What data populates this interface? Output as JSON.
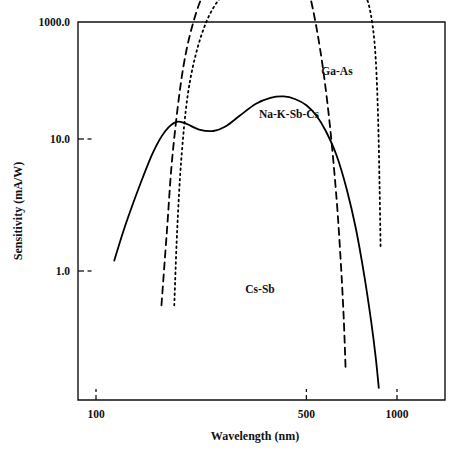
{
  "chart_data": {
    "type": "line",
    "title": "",
    "xlabel": "Wavelength (nm)",
    "ylabel": "Sensitivity (mA/W)",
    "xscale": "log",
    "yscale": "log",
    "xlim": [
      100,
      1300
    ],
    "ylim": [
      0.1,
      1000
    ],
    "xticks": [
      100,
      500,
      1000
    ],
    "xtick_labels": [
      "100",
      "500",
      "1000"
    ],
    "yticks": [
      1.0,
      10.0,
      1000.0
    ],
    "ytick_labels": [
      "1.0",
      "10.0",
      "1000.0"
    ],
    "grid": false,
    "legend": "inline-labels",
    "series": [
      {
        "name": "Cs-Sb",
        "style": "dashed",
        "label": "Cs-Sb",
        "label_x": 260,
        "label_y": 293,
        "x": [
          165,
          172,
          180,
          195,
          215,
          240,
          270,
          300,
          330,
          360,
          390,
          420,
          450,
          480,
          510,
          540,
          570,
          600,
          630,
          650,
          665,
          675
        ],
        "y": [
          0.55,
          2.0,
          8.0,
          35,
          90,
          160,
          230,
          290,
          330,
          350,
          345,
          320,
          270,
          200,
          130,
          70,
          32,
          12,
          3.5,
          1.2,
          0.45,
          0.18
        ]
      },
      {
        "name": "Na-K-Sb-Cs",
        "style": "solid",
        "label": "Na-K-Sb-Cs",
        "label_x": 289,
        "label_y": 118,
        "x": [
          115,
          125,
          140,
          155,
          170,
          185,
          200,
          220,
          245,
          270,
          300,
          340,
          380,
          420,
          460,
          500,
          540,
          580,
          630,
          680,
          730,
          780,
          820,
          850,
          870
        ],
        "y": [
          1.2,
          2.2,
          4.5,
          8.0,
          11.5,
          13.5,
          13.0,
          11.8,
          11.5,
          12.5,
          15.0,
          18.5,
          20.5,
          21.0,
          20.0,
          18.0,
          15.0,
          11.5,
          7.5,
          4.2,
          2.1,
          0.9,
          0.42,
          0.22,
          0.13
        ]
      },
      {
        "name": "Ga-As",
        "style": "dotted",
        "label": "Ga-As",
        "label_x": 337,
        "label_y": 75,
        "x": [
          182,
          186,
          192,
          202,
          218,
          240,
          270,
          310,
          360,
          420,
          490,
          560,
          630,
          700,
          760,
          800,
          830,
          850,
          865,
          875,
          882
        ],
        "y": [
          0.55,
          2.0,
          7.0,
          22,
          50,
          90,
          130,
          160,
          175,
          180,
          180,
          175,
          168,
          155,
          135,
          110,
          72,
          40,
          15,
          4.5,
          1.5
        ]
      }
    ]
  },
  "figure": {
    "ylabel": "Sensitivity (mA/W)",
    "xlabel": "Wavelength (nm)"
  }
}
